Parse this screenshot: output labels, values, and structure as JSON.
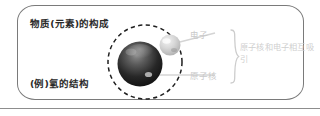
{
  "figure": {
    "title_composition": "物质(元素)的构成",
    "title_example": "(例)氢的结构",
    "labels": {
      "electron": "电子",
      "nucleus": "原子核",
      "attraction": "原子核和电子相互吸引"
    },
    "icons": {
      "nucleus_sphere": "nucleus-sphere-icon",
      "electron_sphere": "electron-sphere-icon",
      "orbit_ring": "dashed-orbit-circle-icon",
      "brace": "right-curly-brace-icon",
      "electron_leader": "electron-leader-line-icon",
      "nucleus_leader": "nucleus-leader-line-icon"
    },
    "colors": {
      "frame_border": "#7a7a7a",
      "footer_rule": "#8d8d8d",
      "text_dark": "#2a2a2a",
      "text_faint": "#c9c9c9",
      "nucleus_dark": "#1b1b1b",
      "nucleus_light": "#8e8e8e",
      "electron_fill": "#cfcfcf",
      "orbit_stroke": "#1f1f1f",
      "leader_line": "#d2d2d2"
    }
  }
}
